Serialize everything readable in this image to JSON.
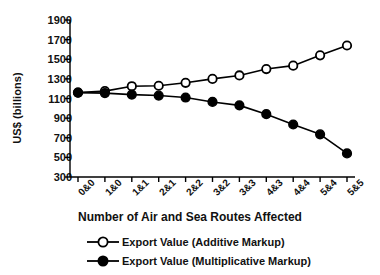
{
  "chart_data": {
    "type": "line",
    "title": "",
    "xlabel": "Number of Air and Sea Routes Affected",
    "ylabel": "US$ (billions)",
    "categories": [
      "0&0",
      "1&0",
      "1&1",
      "2&1",
      "2&2",
      "3&2",
      "3&3",
      "4&3",
      "4&4",
      "5&4",
      "5&5"
    ],
    "ylim": [
      300,
      1900
    ],
    "yticks": [
      300,
      500,
      700,
      900,
      1100,
      1300,
      1500,
      1700,
      1900
    ],
    "grid": false,
    "legend_position": "bottom",
    "series": [
      {
        "name": "Export Value (Additive Markup)",
        "marker": "open-circle",
        "color": "#000000",
        "values": [
          1160,
          1175,
          1225,
          1230,
          1260,
          1300,
          1335,
          1400,
          1435,
          1540,
          1640
        ]
      },
      {
        "name": "Export Value (Multiplicative Markup)",
        "marker": "filled-circle",
        "color": "#000000",
        "values": [
          1160,
          1155,
          1140,
          1130,
          1110,
          1065,
          1030,
          940,
          835,
          735,
          540
        ]
      }
    ]
  },
  "legend": {
    "items": [
      {
        "label": "Export Value (Additive Markup)",
        "marker": "open-circle"
      },
      {
        "label": "Export Value (Multiplicative Markup)",
        "marker": "filled-circle"
      }
    ]
  }
}
